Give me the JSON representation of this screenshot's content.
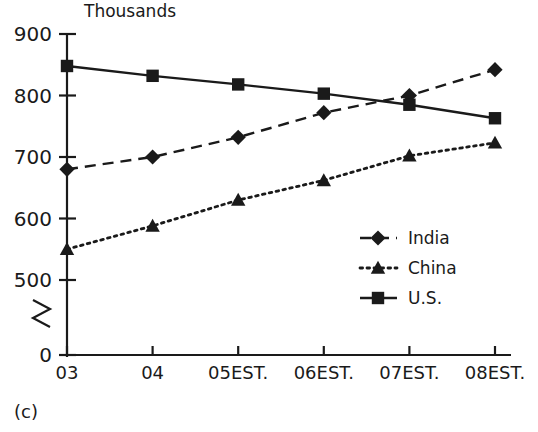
{
  "caption": "(c)",
  "chart_data": {
    "type": "line",
    "title": "",
    "axis_unit_label": "Thousands",
    "xlabel": "",
    "ylabel": "",
    "categories": [
      "03",
      "04",
      "05EST.",
      "06EST.",
      "07EST.",
      "08EST."
    ],
    "ylim": [
      0,
      900
    ],
    "y_ticks": [
      "0",
      "500",
      "600",
      "700",
      "800",
      "900"
    ],
    "y_axis_break": true,
    "y_axis_break_symbol": "zigzag",
    "grid": false,
    "legend_position": "center-right",
    "series": [
      {
        "name": "India",
        "marker": "diamond",
        "line_style": "dashed",
        "color": "#1a1a1a",
        "values": [
          680,
          700,
          732,
          772,
          800,
          842
        ]
      },
      {
        "name": "China",
        "marker": "triangle",
        "line_style": "dotted",
        "color": "#1a1a1a",
        "values": [
          550,
          588,
          630,
          662,
          702,
          723
        ]
      },
      {
        "name": "U.S.",
        "marker": "square",
        "line_style": "solid",
        "color": "#1a1a1a",
        "values": [
          848,
          832,
          818,
          803,
          785,
          763
        ]
      }
    ]
  }
}
